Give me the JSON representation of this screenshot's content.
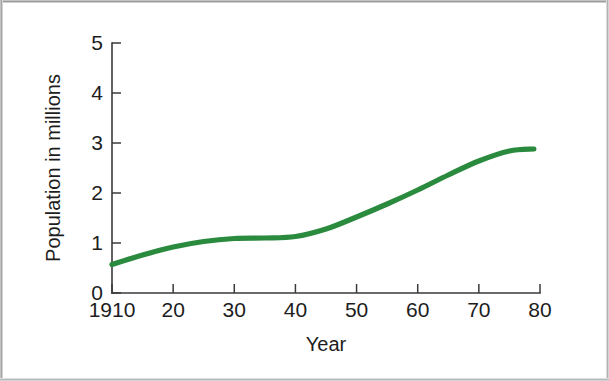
{
  "figure": {
    "background_color": "#ffffff",
    "frame_color": "#9a9a9a"
  },
  "chart_data": {
    "type": "line",
    "title": "",
    "xlabel": "Year",
    "ylabel": "Population in millions",
    "xlim": [
      1910,
      1980
    ],
    "ylim": [
      0,
      5
    ],
    "grid": false,
    "legend": null,
    "line_color": "#2a8a3e",
    "x_tick_labels": [
      "1910",
      "20",
      "30",
      "40",
      "50",
      "60",
      "70",
      "80"
    ],
    "x_tick_values": [
      1910,
      1920,
      1930,
      1940,
      1950,
      1960,
      1970,
      1980
    ],
    "y_tick_labels": [
      "0",
      "1",
      "2",
      "3",
      "4",
      "5"
    ],
    "y_tick_values": [
      0,
      1,
      2,
      3,
      4,
      5
    ],
    "series": [
      {
        "name": "Population",
        "x": [
          1910,
          1915,
          1920,
          1925,
          1930,
          1935,
          1940,
          1945,
          1950,
          1955,
          1960,
          1965,
          1970,
          1975,
          1979
        ],
        "values": [
          0.57,
          0.76,
          0.92,
          1.03,
          1.09,
          1.1,
          1.13,
          1.28,
          1.52,
          1.78,
          2.06,
          2.36,
          2.64,
          2.84,
          2.88
        ]
      }
    ]
  }
}
